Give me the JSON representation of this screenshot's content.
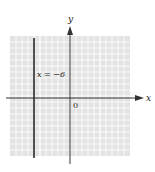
{
  "figure": {
    "type": "coordinate-plane",
    "axis_labels": {
      "x": "x",
      "y": "y"
    },
    "origin_label": "0",
    "grid": {
      "x_range": [
        -10,
        10
      ],
      "y_range": [
        -10,
        10
      ],
      "minor_step": 1,
      "major_every": 5
    },
    "lines": [
      {
        "equation_label": "x = −6",
        "kind": "vertical",
        "x": -6
      }
    ],
    "colors": {
      "grid_bg": "#e3e3e3",
      "grid_line": "#ffffff",
      "axis": "#333333",
      "graph_line": "#2a2a2a"
    }
  }
}
